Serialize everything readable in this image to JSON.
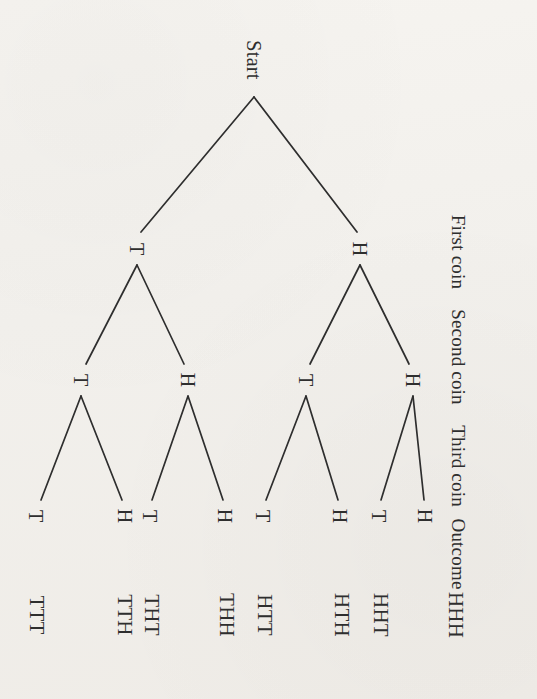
{
  "figure": {
    "type": "probability-tree-diagram",
    "root_label": "Start",
    "text_rotation_degrees": 90,
    "background_color": "#f2f0ec",
    "ink_color": "#2e2e2e"
  },
  "stage_labels": [
    {
      "id": "stage-first-coin",
      "text": "First coin",
      "x": 458,
      "y": 252
    },
    {
      "id": "stage-second-coin",
      "text": "Second coin",
      "x": 458,
      "y": 357
    },
    {
      "id": "stage-third-coin",
      "text": "Third coin",
      "x": 458,
      "y": 466
    },
    {
      "id": "stage-outcome",
      "text": "Outcome",
      "x": 458,
      "y": 554
    }
  ],
  "root": {
    "label": "Start",
    "x": 254,
    "y": 60
  },
  "level1": [
    {
      "label": "T",
      "x": 137,
      "y": 249
    },
    {
      "label": "H",
      "x": 360,
      "y": 249
    }
  ],
  "level2": [
    {
      "label": "T",
      "x": 81,
      "y": 380
    },
    {
      "label": "H",
      "x": 188,
      "y": 380
    },
    {
      "label": "T",
      "x": 306,
      "y": 380
    },
    {
      "label": "H",
      "x": 413,
      "y": 380
    }
  ],
  "level3": [
    {
      "label": "T",
      "x": 36,
      "y": 516
    },
    {
      "label": "H",
      "x": 125,
      "y": 516
    },
    {
      "label": "T",
      "x": 150,
      "y": 516
    },
    {
      "label": "H",
      "x": 225,
      "y": 516
    },
    {
      "label": "T",
      "x": 263,
      "y": 516
    },
    {
      "label": "H",
      "x": 340,
      "y": 516
    },
    {
      "label": "T",
      "x": 379,
      "y": 516
    },
    {
      "label": "H",
      "x": 425,
      "y": 516
    }
  ],
  "outcomes": [
    {
      "label": "TTT",
      "x": 36,
      "y": 615
    },
    {
      "label": "TTH",
      "x": 124,
      "y": 615
    },
    {
      "label": "THT",
      "x": 151,
      "y": 615
    },
    {
      "label": "THH",
      "x": 226,
      "y": 615
    },
    {
      "label": "HTT",
      "x": 264,
      "y": 615
    },
    {
      "label": "HTH",
      "x": 341,
      "y": 615
    },
    {
      "label": "HHT",
      "x": 380,
      "y": 615
    },
    {
      "label": "HHH",
      "x": 455,
      "y": 615
    }
  ],
  "edges": [
    {
      "from": "start",
      "to": "level1-T",
      "x1": 254,
      "y1": 97,
      "x2": 141,
      "y2": 232
    },
    {
      "from": "start",
      "to": "level1-H",
      "x1": 254,
      "y1": 97,
      "x2": 357,
      "y2": 232
    },
    {
      "from": "level1-T",
      "to": "level2-T",
      "x1": 137,
      "y1": 265,
      "x2": 86,
      "y2": 364
    },
    {
      "from": "level1-T",
      "to": "level2-H",
      "x1": 137,
      "y1": 265,
      "x2": 184,
      "y2": 364
    },
    {
      "from": "level1-H",
      "to": "level2-T",
      "x1": 360,
      "y1": 265,
      "x2": 310,
      "y2": 364
    },
    {
      "from": "level1-H",
      "to": "level2-H",
      "x1": 360,
      "y1": 265,
      "x2": 409,
      "y2": 364
    },
    {
      "from": "level2-T1",
      "to": "leaf-1",
      "x1": 81,
      "y1": 396,
      "x2": 41,
      "y2": 500
    },
    {
      "from": "level2-T1",
      "to": "leaf-2",
      "x1": 81,
      "y1": 396,
      "x2": 122,
      "y2": 500
    },
    {
      "from": "level2-H1",
      "to": "leaf-3",
      "x1": 188,
      "y1": 396,
      "x2": 152,
      "y2": 500
    },
    {
      "from": "level2-H1",
      "to": "leaf-4",
      "x1": 188,
      "y1": 396,
      "x2": 223,
      "y2": 500
    },
    {
      "from": "level2-T2",
      "to": "leaf-5",
      "x1": 306,
      "y1": 396,
      "x2": 266,
      "y2": 500
    },
    {
      "from": "level2-T2",
      "to": "leaf-6",
      "x1": 306,
      "y1": 396,
      "x2": 338,
      "y2": 500
    },
    {
      "from": "level2-H2",
      "to": "leaf-7",
      "x1": 413,
      "y1": 396,
      "x2": 381,
      "y2": 500
    },
    {
      "from": "level2-H2",
      "to": "leaf-8",
      "x1": 413,
      "y1": 396,
      "x2": 424,
      "y2": 500
    }
  ]
}
